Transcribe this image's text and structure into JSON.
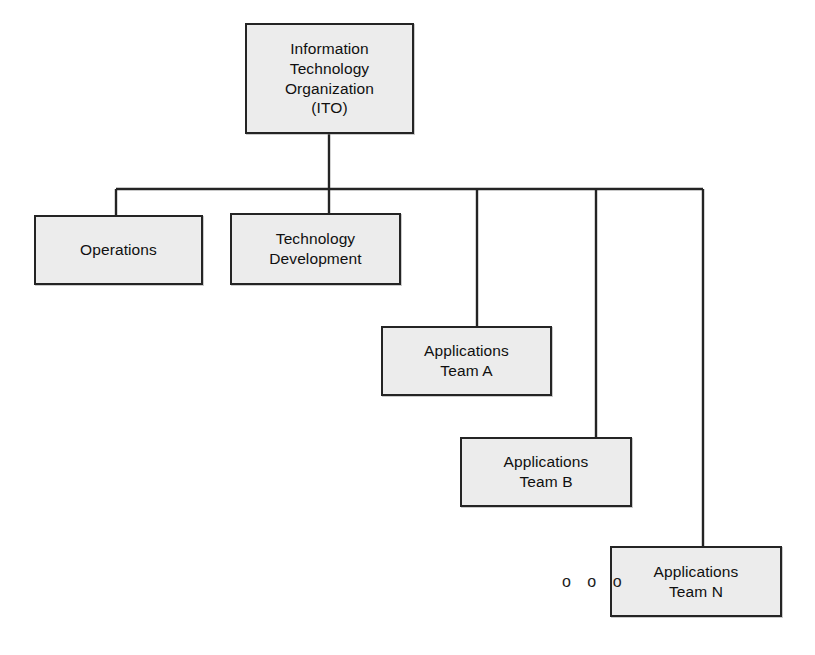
{
  "diagram": {
    "type": "org-chart",
    "style": {
      "node_fill": "#ececec",
      "node_border": "#242424",
      "connector_color": "#242424",
      "background": "#ffffff",
      "text_color": "#101010"
    },
    "nodes": [
      {
        "id": "ito",
        "label": "Information\nTechnology\nOrganization\n(ITO)",
        "x": 245,
        "y": 23,
        "width": 169,
        "height": 111,
        "level": 0
      },
      {
        "id": "operations",
        "label": "Operations",
        "x": 34,
        "y": 215,
        "width": 169,
        "height": 70,
        "level": 1
      },
      {
        "id": "technology-development",
        "label": "Technology\nDevelopment",
        "x": 230,
        "y": 213,
        "width": 171,
        "height": 72,
        "level": 1
      },
      {
        "id": "applications-team-a",
        "label": "Applications\nTeam A",
        "x": 381,
        "y": 326,
        "width": 171,
        "height": 70,
        "level": 1
      },
      {
        "id": "applications-team-b",
        "label": "Applications\nTeam B",
        "x": 460,
        "y": 437,
        "width": 172,
        "height": 70,
        "level": 1
      },
      {
        "id": "applications-team-n",
        "label": "Applications\nTeam N",
        "x": 610,
        "y": 546,
        "width": 172,
        "height": 71,
        "level": 1
      }
    ],
    "ellipsis": {
      "label": "o o o",
      "x": 562,
      "y": 574
    },
    "connectors": {
      "root_stem": {
        "x": 329,
        "y1": 134,
        "y2": 189
      },
      "bus": {
        "y": 189,
        "x1": 116,
        "x2": 703
      },
      "drops": [
        {
          "to": "operations",
          "x": 116,
          "y1": 189,
          "y2": 215
        },
        {
          "to": "technology-development",
          "x": 329,
          "y1": 189,
          "y2": 213
        },
        {
          "to": "applications-team-a",
          "x": 477,
          "y1": 189,
          "y2": 326
        },
        {
          "to": "applications-team-b",
          "x": 596,
          "y1": 189,
          "y2": 437
        },
        {
          "to": "applications-team-n",
          "x": 703,
          "y1": 189,
          "y2": 546
        }
      ]
    }
  }
}
